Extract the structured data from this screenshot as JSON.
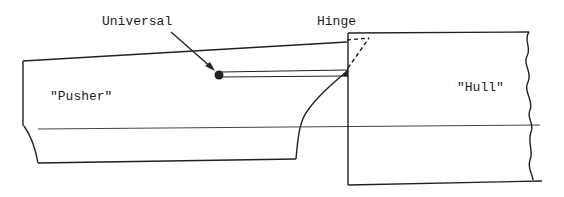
{
  "diagram": {
    "labels": {
      "universal": "Universal",
      "hinge": "Hinge",
      "pusher": "\"Pusher\"",
      "hull": "\"Hull\""
    },
    "colors": {
      "line": "#222222",
      "waterline": "#444444",
      "background": "#ffffff"
    },
    "components": [
      {
        "name": "pusher",
        "description": "Pusher vessel hull outline (left)"
      },
      {
        "name": "hull",
        "description": "Barge/hull outline (right) with broken-off wavy right edge"
      },
      {
        "name": "universal-joint",
        "description": "Ball joint on pusher end of connecting rod"
      },
      {
        "name": "connecting-rod",
        "description": "Double-line rod from universal joint to hinge"
      },
      {
        "name": "hinge",
        "description": "Hinge point at hull corner with dashed swing arc"
      },
      {
        "name": "waterline",
        "description": "Horizontal waterline across both vessels"
      }
    ]
  }
}
